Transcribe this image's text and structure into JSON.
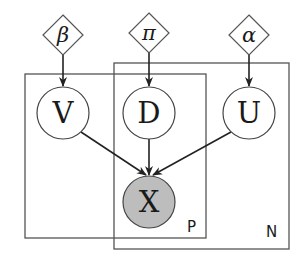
{
  "diagram": {
    "type": "plate-notation graphical model",
    "parameters": [
      {
        "id": "beta",
        "label": "β",
        "cx": 63,
        "cy": 35
      },
      {
        "id": "pi",
        "label": "π",
        "cx": 149,
        "cy": 33
      },
      {
        "id": "alpha",
        "label": "α",
        "cx": 249,
        "cy": 35
      }
    ],
    "latent_nodes": [
      {
        "id": "V",
        "label": "V",
        "cx": 63,
        "cy": 113
      },
      {
        "id": "D",
        "label": "D",
        "cx": 149,
        "cy": 113
      },
      {
        "id": "U",
        "label": "U",
        "cx": 249,
        "cy": 113
      }
    ],
    "observed_nodes": [
      {
        "id": "X",
        "label": "X",
        "cx": 149,
        "cy": 202,
        "fill": "#bdbdbd"
      }
    ],
    "plates": [
      {
        "id": "P",
        "label": "P",
        "x": 25,
        "y": 74,
        "w": 181,
        "h": 164
      },
      {
        "id": "N",
        "label": "N",
        "x": 114,
        "y": 63,
        "w": 175,
        "h": 186
      }
    ],
    "edges": [
      {
        "from": "beta",
        "to": "V"
      },
      {
        "from": "pi",
        "to": "D"
      },
      {
        "from": "alpha",
        "to": "U"
      },
      {
        "from": "V",
        "to": "X"
      },
      {
        "from": "D",
        "to": "X"
      },
      {
        "from": "U",
        "to": "X"
      }
    ]
  }
}
